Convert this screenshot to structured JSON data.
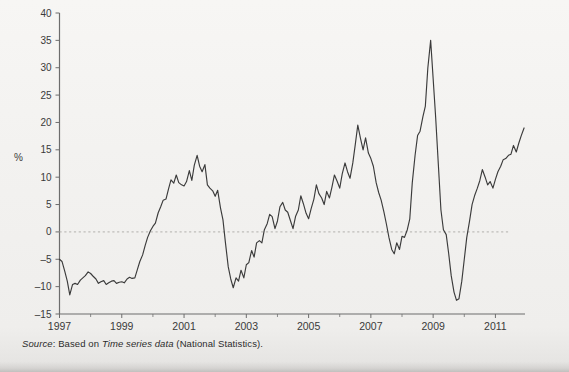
{
  "figure": {
    "y_axis_title": "%",
    "source_prefix": "Source",
    "source_sep": ": Based on ",
    "source_italic": "Time series data",
    "source_suffix": " (National Statistics)."
  },
  "chart_data": {
    "type": "line",
    "title": "",
    "xlabel": "",
    "ylabel": "%",
    "ylim": [
      -15,
      40
    ],
    "xlim": [
      1997.0,
      2011.95
    ],
    "yticks": [
      -15,
      -10,
      -5,
      0,
      5,
      10,
      15,
      20,
      25,
      30,
      35,
      40
    ],
    "ytick_labels": [
      "–15",
      "–10",
      "–5",
      "0",
      "5",
      "10",
      "15",
      "20",
      "25",
      "30",
      "35",
      "40"
    ],
    "xticks": [
      1997,
      1999,
      2001,
      2003,
      2005,
      2007,
      2009,
      2011
    ],
    "xtick_labels": [
      "1997",
      "1999",
      "2001",
      "2003",
      "2005",
      "2007",
      "2009",
      "2011"
    ],
    "xminor_ticks": [
      1998,
      2000,
      2002,
      2004,
      2006,
      2008,
      2010
    ],
    "grid": false,
    "zero_line": 0,
    "zero_line_style": "dotted",
    "line_color": "#3b3b3b",
    "legend": null,
    "series": [
      {
        "name": "annual percentage change",
        "x": [
          1997.0,
          1997.08,
          1997.17,
          1997.25,
          1997.33,
          1997.42,
          1997.5,
          1997.58,
          1997.67,
          1997.75,
          1997.83,
          1997.92,
          1998.0,
          1998.08,
          1998.17,
          1998.25,
          1998.33,
          1998.42,
          1998.5,
          1998.58,
          1998.67,
          1998.75,
          1998.83,
          1998.92,
          1999.0,
          1999.08,
          1999.17,
          1999.25,
          1999.33,
          1999.42,
          1999.5,
          1999.58,
          1999.67,
          1999.75,
          1999.83,
          1999.92,
          2000.0,
          2000.08,
          2000.17,
          2000.25,
          2000.33,
          2000.42,
          2000.5,
          2000.58,
          2000.67,
          2000.75,
          2000.83,
          2000.92,
          2001.0,
          2001.08,
          2001.17,
          2001.25,
          2001.33,
          2001.42,
          2001.5,
          2001.58,
          2001.67,
          2001.75,
          2001.83,
          2001.92,
          2002.0,
          2002.08,
          2002.17,
          2002.25,
          2002.33,
          2002.42,
          2002.5,
          2002.58,
          2002.67,
          2002.75,
          2002.83,
          2002.92,
          2003.0,
          2003.08,
          2003.17,
          2003.25,
          2003.33,
          2003.42,
          2003.5,
          2003.58,
          2003.67,
          2003.75,
          2003.83,
          2003.92,
          2004.0,
          2004.08,
          2004.17,
          2004.25,
          2004.33,
          2004.42,
          2004.5,
          2004.58,
          2004.67,
          2004.75,
          2004.83,
          2004.92,
          2005.0,
          2005.08,
          2005.17,
          2005.25,
          2005.33,
          2005.42,
          2005.5,
          2005.58,
          2005.67,
          2005.75,
          2005.83,
          2005.92,
          2006.0,
          2006.08,
          2006.17,
          2006.25,
          2006.33,
          2006.42,
          2006.5,
          2006.58,
          2006.67,
          2006.75,
          2006.83,
          2006.92,
          2007.0,
          2007.08,
          2007.17,
          2007.25,
          2007.33,
          2007.42,
          2007.5,
          2007.58,
          2007.67,
          2007.75,
          2007.83,
          2007.92,
          2008.0,
          2008.08,
          2008.17,
          2008.25,
          2008.33,
          2008.42,
          2008.5,
          2008.58,
          2008.67,
          2008.75,
          2008.83,
          2008.92,
          2009.0,
          2009.08,
          2009.17,
          2009.25,
          2009.33,
          2009.42,
          2009.5,
          2009.58,
          2009.67,
          2009.75,
          2009.83,
          2009.92,
          2010.0,
          2010.08,
          2010.17,
          2010.25,
          2010.33,
          2010.42,
          2010.5,
          2010.58,
          2010.67,
          2010.75,
          2010.83,
          2010.92,
          2011.0,
          2011.08,
          2011.17,
          2011.25,
          2011.33,
          2011.42,
          2011.5,
          2011.58,
          2011.67,
          2011.75,
          2011.83,
          2011.92
        ],
        "y": [
          -5.0,
          -5.4,
          -7.2,
          -9.0,
          -11.5,
          -9.6,
          -9.4,
          -9.6,
          -8.8,
          -8.4,
          -8.0,
          -7.3,
          -7.6,
          -8.1,
          -8.6,
          -9.4,
          -9.1,
          -8.9,
          -9.6,
          -9.3,
          -9.0,
          -8.9,
          -9.4,
          -9.2,
          -9.1,
          -9.3,
          -8.6,
          -8.3,
          -8.5,
          -8.4,
          -6.9,
          -5.4,
          -4.2,
          -2.5,
          -1.0,
          0.2,
          1.0,
          1.6,
          3.5,
          4.6,
          5.8,
          6.0,
          7.8,
          9.5,
          8.9,
          10.4,
          9.0,
          8.6,
          8.4,
          9.2,
          11.2,
          9.4,
          12.2,
          14.0,
          12.0,
          11.0,
          12.3,
          8.6,
          8.0,
          7.5,
          6.5,
          7.6,
          4.4,
          2.2,
          -2.0,
          -6.4,
          -8.6,
          -10.2,
          -8.4,
          -9.0,
          -7.0,
          -8.4,
          -6.0,
          -5.6,
          -3.4,
          -4.6,
          -2.0,
          -1.6,
          -2.0,
          0.4,
          1.5,
          3.2,
          2.8,
          0.6,
          2.0,
          4.6,
          5.4,
          4.0,
          3.6,
          2.0,
          0.6,
          2.8,
          4.0,
          6.6,
          5.2,
          3.4,
          2.4,
          4.2,
          6.0,
          8.6,
          7.0,
          6.2,
          5.0,
          7.4,
          6.2,
          8.2,
          10.4,
          9.2,
          8.0,
          10.6,
          12.6,
          11.0,
          9.8,
          12.6,
          16.0,
          19.5,
          17.0,
          15.0,
          17.2,
          14.4,
          13.4,
          12.0,
          9.0,
          7.2,
          5.8,
          3.6,
          1.4,
          -1.0,
          -3.2,
          -4.0,
          -2.0,
          -3.2,
          -0.8,
          -1.0,
          0.4,
          2.4,
          9.0,
          14.0,
          17.6,
          18.4,
          21.0,
          23.0,
          30.0,
          35.0,
          28.0,
          21.0,
          12.0,
          4.0,
          0.4,
          -0.5,
          -4.0,
          -8.0,
          -11.0,
          -12.5,
          -12.2,
          -9.0,
          -5.0,
          -1.0,
          2.0,
          5.0,
          6.6,
          8.0,
          9.4,
          11.4,
          10.0,
          8.6,
          9.2,
          8.0,
          9.6,
          11.0,
          12.0,
          13.2,
          13.4,
          14.0,
          14.2,
          15.8,
          14.6,
          16.2,
          17.6,
          19.0
        ]
      }
    ],
    "annotations": {
      "peak_2008": 35,
      "trough_2009": -12.5,
      "peak_2006": 19.5,
      "peak_2000": 14,
      "start_value": -5,
      "end_value": 19
    }
  }
}
